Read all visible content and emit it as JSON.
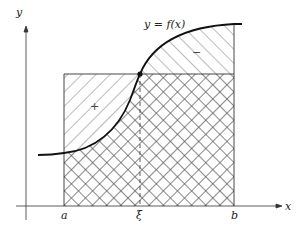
{
  "diagram": {
    "axes": {
      "x_label": "x",
      "y_label": "y"
    },
    "ticks": {
      "a": "a",
      "xi": "ξ",
      "b": "b"
    },
    "curve_label": "y = f(x)",
    "regions": {
      "plus": "+",
      "minus": "−"
    },
    "colors": {
      "stroke": "#222222",
      "hatch": "#555555",
      "background": "#ffffff"
    }
  }
}
